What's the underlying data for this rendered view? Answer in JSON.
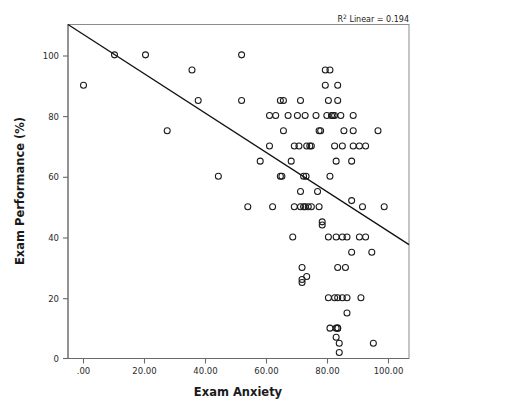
{
  "chart_data": {
    "type": "scatter",
    "title": "",
    "xlabel": "Exam Anxiety",
    "ylabel": "Exam Performance (%)",
    "xlim": [
      -5,
      105
    ],
    "ylim": [
      0,
      110
    ],
    "grid": false,
    "legend": null,
    "annotation": {
      "r_squared_prefix": "R",
      "r_squared_sup": "2",
      "r_squared_text": " Linear = 0.194",
      "full_text": "R² Linear = 0.194",
      "value": 0.194
    },
    "fit_line": {
      "type": "linear",
      "x_start": -5,
      "y_start": 110,
      "x_end": 105,
      "y_end": 37.5,
      "slope": -0.659,
      "intercept": 106.7
    },
    "xticks": [
      0,
      20,
      40,
      60,
      80,
      100
    ],
    "xtick_labels": [
      ".00",
      "20.00",
      "40.00",
      "60.00",
      "80.00",
      "100.00"
    ],
    "yticks": [
      0,
      20,
      40,
      60,
      80,
      100
    ],
    "ytick_labels": [
      "0",
      "20",
      "40",
      "60",
      "80",
      "100"
    ],
    "marker": {
      "shape": "open-circle",
      "radius": 3,
      "edge_color": "#1b1b1b",
      "fill": "none"
    },
    "points": [
      [
        0,
        90
      ],
      [
        10,
        100
      ],
      [
        20,
        100
      ],
      [
        27,
        75
      ],
      [
        35,
        95
      ],
      [
        37,
        85
      ],
      [
        43.5,
        60
      ],
      [
        51,
        100
      ],
      [
        51,
        85
      ],
      [
        53,
        50
      ],
      [
        57,
        65
      ],
      [
        60,
        80
      ],
      [
        60,
        70
      ],
      [
        61,
        50
      ],
      [
        62,
        80
      ],
      [
        63.5,
        85
      ],
      [
        63.5,
        60
      ],
      [
        64,
        60
      ],
      [
        64.5,
        85
      ],
      [
        64.5,
        75
      ],
      [
        66,
        80
      ],
      [
        67,
        65
      ],
      [
        67.5,
        40
      ],
      [
        68,
        50
      ],
      [
        68,
        70
      ],
      [
        69,
        80
      ],
      [
        69.5,
        70
      ],
      [
        70,
        85
      ],
      [
        70,
        55
      ],
      [
        70,
        50
      ],
      [
        70.5,
        25
      ],
      [
        70.5,
        26
      ],
      [
        70.5,
        30
      ],
      [
        71,
        50
      ],
      [
        71,
        60
      ],
      [
        71.5,
        50
      ],
      [
        71.5,
        80
      ],
      [
        71.8,
        60
      ],
      [
        72,
        70
      ],
      [
        72,
        27
      ],
      [
        72.5,
        50
      ],
      [
        73,
        70
      ],
      [
        73.5,
        70
      ],
      [
        73.5,
        50
      ],
      [
        75,
        80
      ],
      [
        75.5,
        55
      ],
      [
        76,
        50
      ],
      [
        76,
        75
      ],
      [
        76.5,
        75
      ],
      [
        77,
        45
      ],
      [
        77,
        44
      ],
      [
        78,
        95
      ],
      [
        78,
        90
      ],
      [
        78.5,
        80
      ],
      [
        79,
        85
      ],
      [
        79.5,
        95
      ],
      [
        79,
        40
      ],
      [
        79,
        20
      ],
      [
        79.5,
        60
      ],
      [
        79.5,
        10
      ],
      [
        80,
        80
      ],
      [
        80.5,
        80
      ],
      [
        81,
        80
      ],
      [
        81,
        70
      ],
      [
        81,
        20
      ],
      [
        81.5,
        65
      ],
      [
        81.5,
        40
      ],
      [
        81.5,
        10
      ],
      [
        81.5,
        7
      ],
      [
        82,
        85
      ],
      [
        82,
        90
      ],
      [
        82,
        30
      ],
      [
        82,
        20
      ],
      [
        82,
        10
      ],
      [
        82,
        10
      ],
      [
        82.5,
        5
      ],
      [
        82.5,
        2
      ],
      [
        83,
        80
      ],
      [
        83.5,
        70
      ],
      [
        83.5,
        40
      ],
      [
        83.5,
        20
      ],
      [
        84,
        75
      ],
      [
        84.5,
        30
      ],
      [
        85,
        40
      ],
      [
        85,
        20
      ],
      [
        85,
        15
      ],
      [
        86.5,
        52
      ],
      [
        86.5,
        65
      ],
      [
        86.5,
        35
      ],
      [
        87,
        75
      ],
      [
        87,
        80
      ],
      [
        87,
        70
      ],
      [
        89,
        70
      ],
      [
        89,
        40
      ],
      [
        89.5,
        20
      ],
      [
        90,
        50
      ],
      [
        91,
        70
      ],
      [
        91,
        40
      ],
      [
        93,
        35
      ],
      [
        93.5,
        5
      ],
      [
        95,
        75
      ],
      [
        97,
        50
      ]
    ],
    "point_count": 103
  },
  "figure": {
    "background": "#ffffff",
    "frame_color": "#8b8b8b",
    "axis_color": "#6a6a6a",
    "line_color": "#111111",
    "text_color": "#1a1a1a"
  }
}
